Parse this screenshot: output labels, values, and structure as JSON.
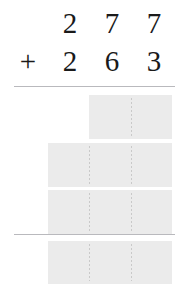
{
  "problem": {
    "operator": "+",
    "addend_top": {
      "hundreds": "2",
      "tens": "7",
      "ones": "7"
    },
    "addend_bottom": {
      "hundreds": "2",
      "tens": "6",
      "ones": "3"
    }
  },
  "answer_rows": [
    {
      "name": "partial-product-row-1",
      "cells": [
        "",
        ""
      ],
      "value": ""
    },
    {
      "name": "partial-product-row-2",
      "cells": [
        "",
        "",
        ""
      ],
      "value": ""
    },
    {
      "name": "partial-product-row-3",
      "cells": [
        "",
        "",
        ""
      ],
      "value": ""
    },
    {
      "name": "total-row",
      "cells": [
        "",
        "",
        ""
      ],
      "value": ""
    }
  ],
  "colors": {
    "text": "#1a1a1a",
    "rule": "#b9b9bd",
    "box_fill": "#ebebeb",
    "cell_divider": "#c9c9c9",
    "page_background": "#ffffff"
  }
}
